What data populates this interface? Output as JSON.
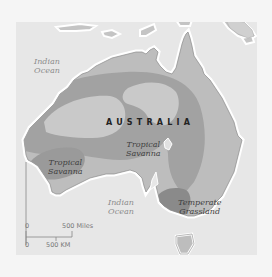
{
  "map": {
    "type": "vegetation-region map",
    "country_label": "AUSTRALIA",
    "ocean_labels": [
      {
        "line1": "Indian",
        "line2": "Ocean",
        "position": "northwest"
      },
      {
        "line1": "Indian",
        "line2": "Ocean",
        "position": "south"
      }
    ],
    "region_labels": [
      {
        "line1": "Tropical",
        "line2": "Savanna",
        "position": "southwest"
      },
      {
        "line1": "Tropical",
        "line2": "Savanna",
        "position": "center"
      },
      {
        "line1": "Temperate",
        "line2": "Grassland",
        "position": "southeast"
      }
    ],
    "scale_bar": {
      "miles_zero": "0",
      "miles_label": "500 Miles",
      "km_zero": "0",
      "km_label": "500 KM"
    },
    "colors": {
      "page_background": "#f5f5f5",
      "ocean": "#e7e7e7",
      "land_light": "#bdbdbd",
      "desert_band": "#a2a2a2",
      "inner_light": "#c9c9c9",
      "temperate_grassland": "#8a8a8a",
      "coast_halo": "#ffffff"
    }
  }
}
